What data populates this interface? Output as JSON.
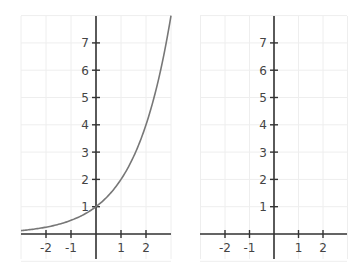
{
  "chart_data": [
    {
      "type": "line",
      "title": "",
      "xlabel": "",
      "ylabel": "",
      "xlim": [
        -3,
        3
      ],
      "ylim": [
        -1,
        8
      ],
      "grid": true,
      "x_ticks": [
        -2,
        -1,
        1,
        2
      ],
      "y_ticks": [
        1,
        2,
        3,
        4,
        5,
        6,
        7
      ],
      "series": [
        {
          "name": "y = 2^x",
          "color": "#777777",
          "x": [
            -3,
            -2,
            -1,
            0,
            1,
            2,
            3
          ],
          "values": [
            0.125,
            0.25,
            0.5,
            1,
            2,
            4,
            8
          ]
        }
      ]
    },
    {
      "type": "line",
      "title": "",
      "xlabel": "",
      "ylabel": "",
      "xlim": [
        -3,
        3
      ],
      "ylim": [
        -1,
        8
      ],
      "grid": true,
      "x_ticks": [
        -2,
        -1,
        1,
        2
      ],
      "y_ticks": [
        1,
        2,
        3,
        4,
        5,
        6,
        7
      ],
      "series": []
    }
  ],
  "panels": [
    {
      "origin_x": 96,
      "origin_y": 234,
      "unit_x": 25,
      "unit_y": 27.3,
      "x_left": 21,
      "x_right": 171,
      "y_top": 16,
      "y_bottom": 259
    },
    {
      "origin_x": 274,
      "origin_y": 234,
      "unit_x": 24.5,
      "unit_y": 27.3,
      "x_left": 200,
      "x_right": 347,
      "y_top": 16,
      "y_bottom": 259
    }
  ]
}
